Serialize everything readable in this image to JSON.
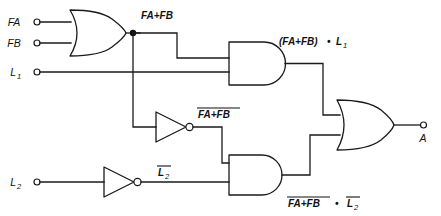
{
  "diagram": {
    "type": "combinational-logic-schematic",
    "line_color": "#1a1a1a",
    "background_color": "#ffffff"
  },
  "inputs": [
    {
      "id": "fa",
      "label": "FA",
      "subscript": ""
    },
    {
      "id": "fb",
      "label": "FB",
      "subscript": ""
    },
    {
      "id": "l1",
      "label": "L",
      "subscript": "1"
    },
    {
      "id": "l2",
      "label": "L",
      "subscript": "2"
    }
  ],
  "output": {
    "id": "a",
    "label": "A"
  },
  "gates": [
    {
      "id": "or1",
      "kind": "OR",
      "inputs": [
        "FA",
        "FB"
      ],
      "output_label": "FA+FB"
    },
    {
      "id": "not1",
      "kind": "NOT",
      "inputs": [
        "FA+FB"
      ],
      "output_label": "FA+FB",
      "output_overline": true
    },
    {
      "id": "not2",
      "kind": "NOT",
      "inputs": [
        "L2"
      ],
      "output_label": "L2",
      "output_overline": true
    },
    {
      "id": "and1",
      "kind": "AND",
      "inputs": [
        "FA+FB",
        "L1"
      ],
      "output_label": "(FA+FB) • L1"
    },
    {
      "id": "and2",
      "kind": "AND",
      "inputs": [
        "NOT(FA+FB)",
        "NOT(L2)"
      ],
      "output_label": "FA+FB • L2"
    },
    {
      "id": "or2",
      "kind": "OR",
      "inputs": [
        "and1",
        "and2"
      ],
      "output_label": "A"
    }
  ],
  "signal_labels": {
    "or1_out": "FA+FB",
    "not1_out_base": "FA+FB",
    "not2_out_base": "L",
    "not2_out_sub": "2",
    "and1_out_prefix": "(FA+FB)",
    "and1_out_dot": "•",
    "and1_out_suffix": "L",
    "and1_out_sub": "1",
    "and2_out_first": "FA+FB",
    "and2_out_dot": "•",
    "and2_out_second": "L",
    "and2_out_second_sub": "2"
  }
}
